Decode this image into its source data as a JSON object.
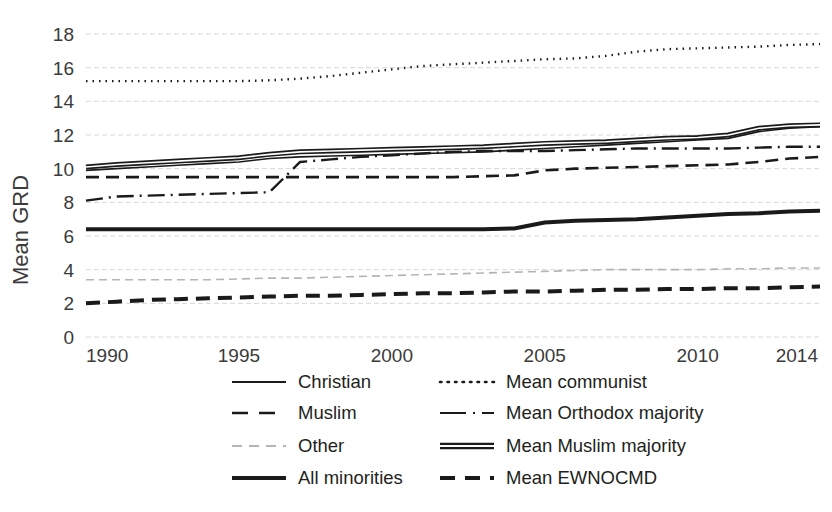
{
  "chart_data": {
    "type": "line",
    "title": "",
    "xlabel": "",
    "ylabel": "Mean GRD",
    "xlim": [
      1990,
      2014
    ],
    "ylim": [
      0,
      18
    ],
    "y_ticks": [
      0,
      2,
      4,
      6,
      8,
      10,
      12,
      14,
      16,
      18
    ],
    "x_ticks": [
      1990,
      1995,
      2000,
      2005,
      2010,
      2014
    ],
    "x_tick_labels": [
      "1990",
      "1995",
      "2000",
      "2005",
      "2010",
      "2014"
    ],
    "y_tick_labels": [
      "0",
      "2",
      "4",
      "6",
      "8",
      "10",
      "12",
      "14",
      "16",
      "18"
    ],
    "grid": true,
    "legend_position": "bottom",
    "x": [
      1990,
      1991,
      1992,
      1993,
      1994,
      1995,
      1996,
      1997,
      1998,
      1999,
      2000,
      2001,
      2002,
      2003,
      2004,
      2005,
      2006,
      2007,
      2008,
      2009,
      2010,
      2011,
      2012,
      2013,
      2014
    ],
    "series": [
      {
        "name": "Christian",
        "style": "solid-thin",
        "color": "#1a1a1a",
        "width": 1.6,
        "dash": "none",
        "values": [
          9.9,
          10.0,
          10.1,
          10.2,
          10.3,
          10.4,
          10.6,
          10.7,
          10.75,
          10.8,
          10.85,
          10.9,
          10.95,
          11.0,
          11.1,
          11.2,
          11.3,
          11.4,
          11.5,
          11.6,
          11.7,
          11.8,
          12.2,
          12.4,
          12.5
        ]
      },
      {
        "name": "Muslim",
        "style": "dashed",
        "color": "#1a1a1a",
        "width": 2.6,
        "dash": "13 7",
        "values": [
          9.5,
          9.5,
          9.5,
          9.5,
          9.5,
          9.5,
          9.5,
          9.5,
          9.5,
          9.5,
          9.5,
          9.5,
          9.5,
          9.55,
          9.6,
          9.9,
          10.0,
          10.05,
          10.1,
          10.15,
          10.2,
          10.25,
          10.4,
          10.6,
          10.7
        ]
      },
      {
        "name": "Other",
        "style": "dashed-light",
        "color": "#b5b5b5",
        "width": 1.6,
        "dash": "8 5",
        "values": [
          3.4,
          3.4,
          3.4,
          3.4,
          3.4,
          3.45,
          3.5,
          3.5,
          3.55,
          3.6,
          3.65,
          3.7,
          3.75,
          3.8,
          3.85,
          3.9,
          3.95,
          4.0,
          4.0,
          4.0,
          4.0,
          4.05,
          4.05,
          4.1,
          4.1
        ]
      },
      {
        "name": "All minorities",
        "style": "solid-thick",
        "color": "#1a1a1a",
        "width": 4.0,
        "dash": "none",
        "values": [
          6.4,
          6.4,
          6.4,
          6.4,
          6.4,
          6.4,
          6.4,
          6.4,
          6.4,
          6.4,
          6.4,
          6.4,
          6.4,
          6.4,
          6.45,
          6.8,
          6.9,
          6.95,
          7.0,
          7.1,
          7.2,
          7.3,
          7.35,
          7.45,
          7.5
        ]
      },
      {
        "name": "Mean communist",
        "style": "dotted",
        "color": "#1a1a1a",
        "width": 2.4,
        "dash": "1.5 5",
        "values": [
          15.2,
          15.2,
          15.2,
          15.2,
          15.2,
          15.2,
          15.25,
          15.35,
          15.5,
          15.7,
          15.9,
          16.1,
          16.2,
          16.3,
          16.4,
          16.5,
          16.55,
          16.7,
          16.95,
          17.1,
          17.15,
          17.2,
          17.25,
          17.35,
          17.4
        ]
      },
      {
        "name": "Mean Orthodox majority",
        "style": "dash-dot",
        "color": "#1a1a1a",
        "width": 2.4,
        "dash": "17 6 2 6",
        "values": [
          8.1,
          8.35,
          8.4,
          8.45,
          8.5,
          8.55,
          8.6,
          10.4,
          10.55,
          10.7,
          10.8,
          10.9,
          11.0,
          11.05,
          11.05,
          11.05,
          11.1,
          11.15,
          11.2,
          11.2,
          11.2,
          11.2,
          11.25,
          11.3,
          11.3
        ]
      },
      {
        "name": "Mean Muslim majority",
        "style": "double-line",
        "color": "#1a1a1a",
        "width": 2.0,
        "dash": "none",
        "values": [
          10.1,
          10.25,
          10.35,
          10.45,
          10.55,
          10.65,
          10.85,
          11.0,
          11.05,
          11.1,
          11.15,
          11.2,
          11.25,
          11.3,
          11.4,
          11.5,
          11.55,
          11.6,
          11.7,
          11.8,
          11.85,
          12.0,
          12.4,
          12.55,
          12.6
        ]
      },
      {
        "name": "Mean EWNOCMD",
        "style": "dashed-thick",
        "color": "#1a1a1a",
        "width": 4.0,
        "dash": "14 8",
        "values": [
          2.0,
          2.1,
          2.2,
          2.25,
          2.3,
          2.35,
          2.4,
          2.45,
          2.45,
          2.5,
          2.55,
          2.6,
          2.6,
          2.65,
          2.7,
          2.7,
          2.75,
          2.8,
          2.8,
          2.85,
          2.85,
          2.9,
          2.9,
          2.95,
          3.0
        ]
      }
    ]
  },
  "legend": {
    "entries": [
      {
        "label": "Christian",
        "key": "christian"
      },
      {
        "label": "Mean communist",
        "key": "mean-communist"
      },
      {
        "label": "Muslim",
        "key": "muslim"
      },
      {
        "label": "Mean Orthodox majority",
        "key": "mean-orthodox-majority"
      },
      {
        "label": "Other",
        "key": "other"
      },
      {
        "label": "Mean Muslim majority",
        "key": "mean-muslim-majority"
      },
      {
        "label": "All minorities",
        "key": "all-minorities"
      },
      {
        "label": "Mean EWNOCMD",
        "key": "mean-ewnocmd"
      }
    ]
  }
}
